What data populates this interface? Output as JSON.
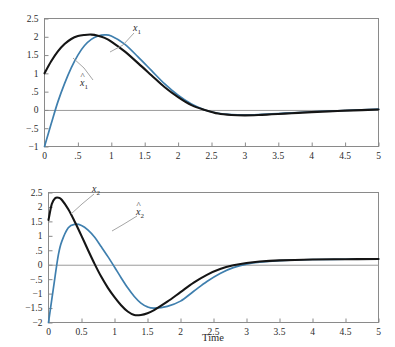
{
  "figure": {
    "title": "",
    "background_color": "#ffffff",
    "frame_color": "#8a8a8a",
    "zero_line_color": "#9a9a9a",
    "black_curve_color": "#151515",
    "blue_curve_color": "#3f7fae",
    "leader_line_color": "#9b9b9b"
  },
  "xlabel": "Time",
  "charts": [
    {
      "id": "x1-panel",
      "xlabel": "",
      "ylabel": "",
      "xticks": [
        "0",
        ".5",
        "1",
        "1.5",
        "2",
        "2.5",
        "3",
        "3.5",
        "4",
        "4.5",
        "5"
      ],
      "xtick_values": [
        0,
        0.5,
        1,
        1.5,
        2,
        2.5,
        3,
        3.5,
        4,
        4.5,
        5
      ],
      "yticks": [
        "2.5",
        "2",
        "1.5",
        "1",
        ".5",
        "0",
        "−.5",
        "−1"
      ],
      "ytick_values": [
        2.5,
        2,
        1.5,
        1,
        0.5,
        0,
        -0.5,
        -1
      ],
      "xlim": [
        0,
        5
      ],
      "ylim": [
        -1,
        2.5
      ],
      "labels": [
        {
          "name": "x1-label",
          "base": "x",
          "sub": "1",
          "hat": false
        },
        {
          "name": "x1-hat-label",
          "base": "x",
          "sub": "1",
          "hat": true
        }
      ]
    },
    {
      "id": "x2-panel",
      "xlabel": "Time",
      "ylabel": "",
      "xticks": [
        "0",
        "0.5",
        "1",
        "1.5",
        "2",
        "2.5",
        "3",
        "3.5",
        "4",
        "4.5",
        "5"
      ],
      "xtick_values": [
        0,
        0.5,
        1,
        1.5,
        2,
        2.5,
        3,
        3.5,
        4,
        4.5,
        5
      ],
      "yticks": [
        "2.5",
        "2",
        "1.5",
        "1",
        ".5",
        "0",
        "−.5",
        "−1",
        "−1.5",
        "−2"
      ],
      "ytick_values": [
        2.5,
        2,
        1.5,
        1,
        0.5,
        0,
        -0.5,
        -1,
        -1.5,
        -2
      ],
      "xlim": [
        0,
        5
      ],
      "ylim": [
        -2,
        2.5
      ],
      "labels": [
        {
          "name": "x2-label",
          "base": "x",
          "sub": "2",
          "hat": false
        },
        {
          "name": "x2-hat-label",
          "base": "x",
          "sub": "2",
          "hat": true
        }
      ]
    }
  ],
  "chart_data": [
    {
      "type": "line",
      "title": "",
      "xlabel": "",
      "ylabel": "",
      "xlim": [
        0,
        5
      ],
      "ylim": [
        -1,
        2.5
      ],
      "xticks": [
        0,
        0.5,
        1,
        1.5,
        2,
        2.5,
        3,
        3.5,
        4,
        4.5,
        5
      ],
      "xticklabels": [
        "0",
        ".5",
        "1",
        "1.5",
        "2",
        "2.5",
        "3",
        "3.5",
        "4",
        "4.5",
        "5"
      ],
      "yticks": [
        2.5,
        2,
        1.5,
        1,
        0.5,
        0,
        -0.5,
        -1
      ],
      "yticklabels": [
        "2.5",
        "2",
        "1.5",
        "1",
        ".5",
        "0",
        "−.5",
        "−1"
      ],
      "grid": false,
      "legend": "inline-annotations",
      "zero_line": true,
      "x": [
        0,
        0.1,
        0.2,
        0.3,
        0.4,
        0.5,
        0.6,
        0.7,
        0.8,
        0.9,
        1.0,
        1.2,
        1.4,
        1.6,
        1.8,
        2.0,
        2.2,
        2.4,
        2.6,
        2.8,
        3.0,
        3.2,
        3.4,
        3.6,
        3.8,
        4.0,
        4.25,
        4.5,
        4.75,
        5.0
      ],
      "series": [
        {
          "name": "x_1",
          "label": "x₁",
          "color": "#151515",
          "values": [
            1.0,
            1.33,
            1.6,
            1.8,
            1.94,
            2.02,
            2.05,
            2.06,
            2.03,
            1.97,
            1.87,
            1.6,
            1.28,
            0.95,
            0.62,
            0.35,
            0.13,
            0.0,
            -0.1,
            -0.14,
            -0.15,
            -0.14,
            -0.12,
            -0.1,
            -0.08,
            -0.06,
            -0.04,
            -0.02,
            -0.005,
            0.01
          ]
        },
        {
          "name": "x_1_hat",
          "label": "x̂₁",
          "color": "#3f7fae",
          "values": [
            -1.0,
            -0.38,
            0.22,
            0.72,
            1.15,
            1.5,
            1.76,
            1.93,
            2.02,
            2.05,
            2.02,
            1.8,
            1.45,
            1.08,
            0.71,
            0.4,
            0.16,
            0.0,
            -0.09,
            -0.13,
            -0.14,
            -0.13,
            -0.11,
            -0.09,
            -0.07,
            -0.05,
            -0.03,
            -0.015,
            0.0,
            0.02
          ]
        }
      ]
    },
    {
      "type": "line",
      "title": "",
      "xlabel": "Time",
      "ylabel": "",
      "xlim": [
        0,
        5
      ],
      "ylim": [
        -2,
        2.5
      ],
      "xticks": [
        0,
        0.5,
        1,
        1.5,
        2,
        2.5,
        3,
        3.5,
        4,
        4.5,
        5
      ],
      "xticklabels": [
        "0",
        "0.5",
        "1",
        "1.5",
        "2",
        "2.5",
        "3",
        "3.5",
        "4",
        "4.5",
        "5"
      ],
      "yticks": [
        2.5,
        2,
        1.5,
        1,
        0.5,
        0,
        -0.5,
        -1,
        -1.5,
        -2
      ],
      "yticklabels": [
        "2.5",
        "2",
        "1.5",
        "1",
        ".5",
        "0",
        "−.5",
        "−1",
        "−1.5",
        "−2"
      ],
      "grid": false,
      "legend": "inline-annotations",
      "zero_line": true,
      "x": [
        0,
        0.05,
        0.1,
        0.15,
        0.2,
        0.3,
        0.4,
        0.5,
        0.6,
        0.7,
        0.8,
        0.9,
        1.0,
        1.1,
        1.2,
        1.3,
        1.4,
        1.5,
        1.6,
        1.8,
        2.0,
        2.2,
        2.4,
        2.6,
        2.8,
        3.0,
        3.2,
        3.5,
        4.0,
        4.5,
        5.0
      ],
      "series": [
        {
          "name": "x_2",
          "label": "x₂",
          "color": "#151515",
          "values": [
            1.55,
            2.1,
            2.3,
            2.32,
            2.25,
            1.92,
            1.48,
            1.0,
            0.5,
            0.02,
            -0.42,
            -0.8,
            -1.12,
            -1.4,
            -1.62,
            -1.74,
            -1.74,
            -1.68,
            -1.57,
            -1.28,
            -0.95,
            -0.62,
            -0.35,
            -0.15,
            -0.02,
            0.06,
            0.11,
            0.15,
            0.18,
            0.19,
            0.2
          ]
        },
        {
          "name": "x_2_hat",
          "label": "x̂₂",
          "color": "#3f7fae",
          "values": [
            -2.0,
            -1.2,
            -0.4,
            0.35,
            0.8,
            1.28,
            1.4,
            1.36,
            1.2,
            0.95,
            0.62,
            0.28,
            -0.08,
            -0.45,
            -0.8,
            -1.1,
            -1.33,
            -1.46,
            -1.5,
            -1.44,
            -1.26,
            -0.92,
            -0.58,
            -0.3,
            -0.1,
            0.02,
            0.09,
            0.14,
            0.18,
            0.19,
            0.2
          ]
        }
      ]
    }
  ]
}
